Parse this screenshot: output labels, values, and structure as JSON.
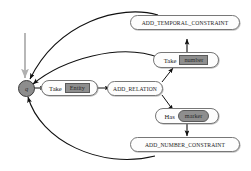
{
  "diagram": {
    "start_node": {
      "label": "q",
      "name": "start-state"
    },
    "entry_arrow": {
      "name": "start-entry-arrow",
      "color": "#b0b0b0"
    },
    "nodes": [
      {
        "id": "add_temporal_constraint",
        "label": "ADD_TEMPORAL_CONSTRAINT",
        "type": "operation"
      },
      {
        "id": "take_number",
        "label": "Take",
        "chip": "number",
        "chip_shape": "rect",
        "type": "action"
      },
      {
        "id": "take_entity",
        "label": "Take",
        "chip": "Entity",
        "chip_shape": "rect",
        "type": "action"
      },
      {
        "id": "add_relation",
        "label": "ADD_RELATION",
        "type": "operation"
      },
      {
        "id": "has_marker",
        "label": "Has",
        "chip": "marker",
        "chip_shape": "rounded",
        "type": "action"
      },
      {
        "id": "add_number_constraint",
        "label": "ADD_NUMBER_CONSTRAINT",
        "type": "operation"
      }
    ],
    "edges": [
      {
        "from": "start",
        "to": "take_entity"
      },
      {
        "from": "take_entity",
        "to": "add_relation"
      },
      {
        "from": "add_relation",
        "to": "take_number"
      },
      {
        "from": "add_relation",
        "to": "has_marker"
      },
      {
        "from": "take_number",
        "to": "add_temporal_constraint"
      },
      {
        "from": "has_marker",
        "to": "add_number_constraint"
      },
      {
        "from": "add_temporal_constraint",
        "to": "start"
      },
      {
        "from": "take_number",
        "to": "start"
      },
      {
        "from": "add_number_constraint",
        "to": "start"
      }
    ],
    "colors": {
      "edge": "#101010",
      "node_border": "#777777",
      "node_fill": "#fdfdfd",
      "chip_fill": "#8e8e8e",
      "start_fill": "#8d8d8d",
      "entry_arrow": "#b0b0b0"
    }
  }
}
